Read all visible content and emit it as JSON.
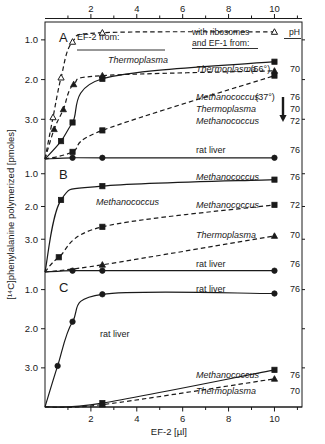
{
  "figure": {
    "xlabel": "EF-2  [µl]",
    "ylabel": "[¹⁴C]phenylalanine  polymerized  [pmoles]",
    "x_ticks": [
      "2",
      "4",
      "6",
      "8",
      "10"
    ],
    "y_ticks": [
      "3.0",
      "2.0",
      "1.0"
    ],
    "panel_letters": [
      "A",
      "B",
      "C"
    ],
    "legend_header_line1": "with ribosomes",
    "legend_header_line2": "and EF-1 from:",
    "legend_header_ph": "pH",
    "ef2_from_label": "EF-2 from:",
    "ink_color": "#1a1a1a"
  },
  "chart_data": {
    "type": "line",
    "title": "",
    "xlabel": "EF-2 [µl]",
    "ylabel": "[14C]phenylalanine polymerized [pmoles]",
    "xlim": [
      0,
      11.2
    ],
    "x_ticks": [
      2,
      4,
      6,
      8,
      10
    ],
    "x_minor_ticks": [
      1,
      3,
      5,
      7,
      9,
      11
    ],
    "ylim": [
      0,
      3.45
    ],
    "y_ticks": [
      1.0,
      2.0,
      3.0
    ],
    "grid": false,
    "legend_position": "right-inside",
    "panels": [
      {
        "letter": "A",
        "inner_label": "Thermoplasma",
        "inner_label_note": "EF-2 from: Thermoplasma",
        "series": [
          {
            "name": "Thermoplasma (56°)",
            "legend_label": "Thermoplasma",
            "legend_suffix": "(56°)",
            "ph": "7.0",
            "marker": "triangle-open",
            "line": "dashed",
            "x": [
              0,
              0.35,
              0.7,
              1.2,
              2.5,
              10
            ],
            "y": [
              0.0,
              1.05,
              2.05,
              2.95,
              3.18,
              3.2
            ]
          },
          {
            "name": "Methanococcus (37°)",
            "legend_label": "Methanococcus",
            "legend_suffix": "(37°)",
            "ph": "7.6",
            "marker": "square-filled",
            "line": "solid",
            "x": [
              0,
              0.7,
              1.2,
              2.5,
              10
            ],
            "y": [
              0.0,
              0.45,
              0.92,
              2.02,
              2.45
            ]
          },
          {
            "name": "Thermoplasma",
            "legend_label": "Thermoplasma",
            "legend_suffix": "",
            "ph": "7.0",
            "marker": "triangle-filled",
            "line": "dashed",
            "x": [
              0,
              0.4,
              0.8,
              1.25,
              2.5,
              10
            ],
            "y": [
              0.0,
              0.75,
              1.25,
              1.88,
              2.1,
              2.22
            ]
          },
          {
            "name": "Methanococcus",
            "legend_label": "Methanococcus",
            "legend_suffix": "",
            "ph": "7.2",
            "marker": "square-filled",
            "line": "dashed",
            "x": [
              0,
              1.2,
              2.5,
              10
            ],
            "y": [
              0.0,
              0.18,
              0.72,
              2.1
            ]
          },
          {
            "name": "rat liver",
            "legend_label": "rat liver",
            "legend_suffix": "",
            "ph": "7.6",
            "marker": "circle-filled",
            "line": "solid",
            "x": [
              0,
              1.2,
              2.5,
              10
            ],
            "y": [
              0.0,
              0.03,
              0.03,
              0.03
            ]
          }
        ]
      },
      {
        "letter": "B",
        "inner_label": "Methanococcus",
        "inner_label_note": "EF-2 from: Methanococcus",
        "series": [
          {
            "name": "Methanococcus",
            "legend_label": "Methanococcus",
            "legend_suffix": "",
            "ph": "7.6",
            "marker": "square-filled",
            "line": "solid",
            "x": [
              0,
              0.7,
              2.5,
              10
            ],
            "y": [
              0.0,
              2.2,
              2.62,
              2.82
            ]
          },
          {
            "name": "Methanococcus",
            "legend_label": "Methanococcus",
            "legend_suffix": "",
            "ph": "7.2",
            "marker": "square-filled",
            "line": "dashed",
            "x": [
              0,
              0.6,
              2.5,
              10
            ],
            "y": [
              0.0,
              0.45,
              1.38,
              2.05
            ]
          },
          {
            "name": "Thermoplasma",
            "legend_label": "Thermoplasma",
            "legend_suffix": "",
            "ph": "7.0",
            "marker": "triangle-filled",
            "line": "dashed",
            "x": [
              0,
              2.5,
              10
            ],
            "y": [
              0.0,
              0.22,
              1.1
            ]
          },
          {
            "name": "rat liver",
            "legend_label": "rat liver",
            "legend_suffix": "",
            "ph": "7.6",
            "marker": "circle-filled",
            "line": "solid",
            "x": [
              0,
              1.2,
              2.5,
              10
            ],
            "y": [
              0.0,
              0.04,
              0.04,
              0.04
            ]
          }
        ]
      },
      {
        "letter": "C",
        "inner_label": "rat liver",
        "inner_label_note": "EF-2 from: rat liver",
        "series": [
          {
            "name": "rat liver",
            "legend_label": "rat liver",
            "legend_suffix": "",
            "ph": "7.6",
            "marker": "circle-filled",
            "line": "solid",
            "x": [
              0,
              0.55,
              1.2,
              2.5,
              10
            ],
            "y": [
              0.0,
              1.05,
              2.18,
              2.88,
              2.9
            ]
          },
          {
            "name": "Methanococcus",
            "legend_label": "Methanococcus",
            "legend_suffix": "",
            "ph": "7.6",
            "marker": "square-filled",
            "line": "solid",
            "x": [
              0,
              2.5,
              10
            ],
            "y": [
              0.0,
              0.1,
              0.95
            ]
          },
          {
            "name": "Thermoplasma",
            "legend_label": "Thermoplasma",
            "legend_suffix": "",
            "ph": "7.0",
            "marker": "triangle-filled",
            "line": "dashed",
            "x": [
              0,
              2.5,
              10
            ],
            "y": [
              0.0,
              0.06,
              0.72
            ]
          }
        ]
      }
    ]
  }
}
